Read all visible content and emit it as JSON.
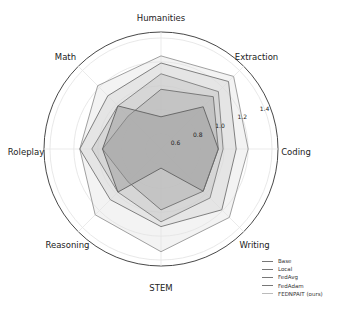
{
  "chart_data": {
    "type": "radar",
    "title": "",
    "categories": [
      "Humanities",
      "Extraction",
      "Coding",
      "Writing",
      "STEM",
      "Reasoning",
      "Roleplay",
      "Math"
    ],
    "radial_ticks": [
      "0.6",
      "0.8",
      "1.0",
      "1.2",
      "1.4"
    ],
    "rlim": [
      0.47,
      1.45
    ],
    "grid": true,
    "legend_position": "lower right",
    "series": [
      {
        "name": "Base",
        "values": [
          0.74,
          0.97,
          0.95,
          0.97,
          0.63,
          0.98,
          0.96,
          0.98
        ],
        "color": "#6a6a6a",
        "fill": "#9a9a9a"
      },
      {
        "name": "Local",
        "values": [
          0.97,
          1.09,
          0.95,
          0.97,
          0.98,
          0.86,
          0.96,
          0.86
        ],
        "color": "#7a7a7a",
        "fill": "#b0b0b0"
      },
      {
        "name": "FedAvg",
        "values": [
          1.1,
          1.15,
          0.99,
          1.05,
          1.08,
          0.98,
          1.05,
          0.98
        ],
        "color": "#888888",
        "fill": "#c4c4c4"
      },
      {
        "name": "FedAdam",
        "values": [
          1.19,
          1.27,
          1.1,
          1.19,
          1.12,
          1.07,
          1.15,
          1.1
        ],
        "color": "#808080",
        "fill": "#d4d4d4"
      },
      {
        "name": "FEDNPAIT (ours)",
        "values": [
          1.25,
          1.33,
          1.2,
          1.28,
          1.33,
          1.25,
          1.15,
          1.22
        ],
        "color": "#a0a0a0",
        "fill": "#e4e4e4"
      }
    ]
  },
  "legend": {
    "items": [
      "Base",
      "Local",
      "FedAvg",
      "FedAdam",
      "FEDNPAIT (ours)"
    ]
  }
}
